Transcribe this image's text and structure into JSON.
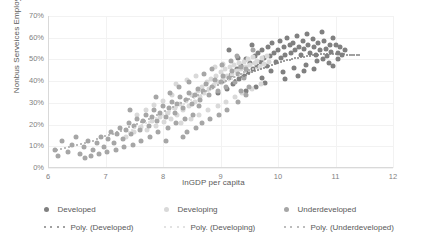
{
  "chart_data": {
    "type": "scatter",
    "title": "",
    "xlabel": "lnGDP per capita",
    "ylabel": "Nonbus Serveices Employment Share",
    "xlim": [
      6,
      12
    ],
    "ylim": [
      0,
      0.7
    ],
    "grid": true,
    "legend_position": "bottom",
    "xticks": [
      "6",
      "7",
      "8",
      "9",
      "10",
      "11",
      "12"
    ],
    "xtick_values": [
      6,
      7,
      8,
      9,
      10,
      11,
      12
    ],
    "yticks": [
      "0%",
      "10%",
      "20%",
      "30%",
      "40%",
      "50%",
      "60%",
      "70%"
    ],
    "ytick_values": [
      0,
      0.1,
      0.2,
      0.3,
      0.4,
      0.5,
      0.6,
      0.7
    ],
    "colors": {
      "developed": "#808080",
      "developing": "#d9d9d9",
      "underdeveloped": "#a6a6a6",
      "gridline": "#f2f2f2",
      "axis": "#d9d9d9",
      "text": "#595959"
    },
    "series": [
      {
        "name": "Developed",
        "color": "#808080",
        "points": [
          [
            8.95,
            0.345
          ],
          [
            9.05,
            0.4
          ],
          [
            9.12,
            0.365
          ],
          [
            9.18,
            0.43
          ],
          [
            9.22,
            0.385
          ],
          [
            9.28,
            0.455
          ],
          [
            9.33,
            0.41
          ],
          [
            9.36,
            0.47
          ],
          [
            9.4,
            0.425
          ],
          [
            9.44,
            0.5
          ],
          [
            9.48,
            0.44
          ],
          [
            9.52,
            0.485
          ],
          [
            9.56,
            0.455
          ],
          [
            9.6,
            0.515
          ],
          [
            9.63,
            0.47
          ],
          [
            9.66,
            0.53
          ],
          [
            9.7,
            0.49
          ],
          [
            9.73,
            0.545
          ],
          [
            9.76,
            0.505
          ],
          [
            9.8,
            0.47
          ],
          [
            9.83,
            0.555
          ],
          [
            9.86,
            0.515
          ],
          [
            9.9,
            0.575
          ],
          [
            9.93,
            0.53
          ],
          [
            9.96,
            0.49
          ],
          [
            10.0,
            0.545
          ],
          [
            10.03,
            0.585
          ],
          [
            10.06,
            0.505
          ],
          [
            10.1,
            0.555
          ],
          [
            10.13,
            0.52
          ],
          [
            10.16,
            0.6
          ],
          [
            10.2,
            0.565
          ],
          [
            10.23,
            0.53
          ],
          [
            10.26,
            0.575
          ],
          [
            10.3,
            0.545
          ],
          [
            10.33,
            0.61
          ],
          [
            10.36,
            0.555
          ],
          [
            10.4,
            0.52
          ],
          [
            10.43,
            0.585
          ],
          [
            10.46,
            0.55
          ],
          [
            10.5,
            0.615
          ],
          [
            10.53,
            0.565
          ],
          [
            10.56,
            0.53
          ],
          [
            10.6,
            0.595
          ],
          [
            10.63,
            0.555
          ],
          [
            10.66,
            0.52
          ],
          [
            10.7,
            0.575
          ],
          [
            10.73,
            0.545
          ],
          [
            10.76,
            0.625
          ],
          [
            10.8,
            0.585
          ],
          [
            10.83,
            0.55
          ],
          [
            10.86,
            0.515
          ],
          [
            10.9,
            0.565
          ],
          [
            10.93,
            0.535
          ],
          [
            10.96,
            0.6
          ],
          [
            11.0,
            0.565
          ],
          [
            11.04,
            0.53
          ],
          [
            11.08,
            0.555
          ],
          [
            11.12,
            0.52
          ],
          [
            11.16,
            0.545
          ],
          [
            9.15,
            0.545
          ],
          [
            9.3,
            0.505
          ],
          [
            9.55,
            0.565
          ],
          [
            9.72,
            0.415
          ],
          [
            9.88,
            0.445
          ],
          [
            10.08,
            0.44
          ],
          [
            10.28,
            0.46
          ],
          [
            10.48,
            0.475
          ],
          [
            10.68,
            0.495
          ],
          [
            10.88,
            0.485
          ],
          [
            10.45,
            0.445
          ],
          [
            10.62,
            0.455
          ],
          [
            10.78,
            0.5
          ],
          [
            10.95,
            0.47
          ],
          [
            11.05,
            0.5
          ],
          [
            9.45,
            0.355
          ],
          [
            9.62,
            0.375
          ],
          [
            9.78,
            0.39
          ],
          [
            10.12,
            0.41
          ],
          [
            10.35,
            0.425
          ]
        ]
      },
      {
        "name": "Developing",
        "color": "#d9d9d9",
        "points": [
          [
            7.35,
            0.145
          ],
          [
            7.5,
            0.165
          ],
          [
            7.62,
            0.19
          ],
          [
            7.72,
            0.175
          ],
          [
            7.8,
            0.215
          ],
          [
            7.88,
            0.195
          ],
          [
            7.95,
            0.235
          ],
          [
            8.02,
            0.21
          ],
          [
            8.08,
            0.255
          ],
          [
            8.14,
            0.225
          ],
          [
            8.2,
            0.275
          ],
          [
            8.25,
            0.245
          ],
          [
            8.3,
            0.295
          ],
          [
            8.35,
            0.265
          ],
          [
            8.4,
            0.315
          ],
          [
            8.45,
            0.285
          ],
          [
            8.5,
            0.335
          ],
          [
            8.55,
            0.305
          ],
          [
            8.6,
            0.355
          ],
          [
            8.64,
            0.325
          ],
          [
            8.68,
            0.375
          ],
          [
            8.72,
            0.345
          ],
          [
            8.76,
            0.395
          ],
          [
            8.8,
            0.365
          ],
          [
            8.84,
            0.41
          ],
          [
            8.88,
            0.38
          ],
          [
            8.92,
            0.425
          ],
          [
            8.96,
            0.395
          ],
          [
            9.0,
            0.44
          ],
          [
            9.04,
            0.41
          ],
          [
            9.08,
            0.455
          ],
          [
            9.12,
            0.425
          ],
          [
            9.16,
            0.465
          ],
          [
            9.2,
            0.435
          ],
          [
            9.24,
            0.475
          ],
          [
            9.28,
            0.445
          ],
          [
            9.32,
            0.485
          ],
          [
            9.36,
            0.455
          ],
          [
            9.4,
            0.49
          ],
          [
            9.44,
            0.465
          ],
          [
            9.48,
            0.5
          ],
          [
            9.52,
            0.475
          ],
          [
            9.56,
            0.51
          ],
          [
            9.6,
            0.485
          ],
          [
            9.64,
            0.495
          ],
          [
            9.68,
            0.465
          ],
          [
            9.72,
            0.505
          ],
          [
            9.76,
            0.48
          ],
          [
            9.8,
            0.515
          ],
          [
            9.84,
            0.49
          ],
          [
            7.55,
            0.245
          ],
          [
            7.7,
            0.265
          ],
          [
            7.85,
            0.29
          ],
          [
            8.0,
            0.31
          ],
          [
            8.15,
            0.335
          ],
          [
            8.32,
            0.205
          ],
          [
            8.48,
            0.225
          ],
          [
            8.62,
            0.245
          ],
          [
            8.78,
            0.265
          ],
          [
            8.95,
            0.285
          ],
          [
            9.1,
            0.305
          ],
          [
            9.25,
            0.325
          ],
          [
            9.38,
            0.345
          ],
          [
            9.55,
            0.365
          ],
          [
            9.7,
            0.385
          ],
          [
            8.22,
            0.385
          ],
          [
            8.42,
            0.405
          ],
          [
            8.58,
            0.425
          ],
          [
            8.9,
            0.465
          ],
          [
            9.05,
            0.48
          ]
        ]
      },
      {
        "name": "Underdeveloped",
        "color": "#a6a6a6",
        "points": [
          [
            6.12,
            0.085
          ],
          [
            6.18,
            0.055
          ],
          [
            6.35,
            0.075
          ],
          [
            6.42,
            0.105
          ],
          [
            6.55,
            0.065
          ],
          [
            6.62,
            0.095
          ],
          [
            6.7,
            0.125
          ],
          [
            6.78,
            0.085
          ],
          [
            6.85,
            0.115
          ],
          [
            6.92,
            0.145
          ],
          [
            6.98,
            0.095
          ],
          [
            7.05,
            0.135
          ],
          [
            7.1,
            0.165
          ],
          [
            7.15,
            0.115
          ],
          [
            7.2,
            0.155
          ],
          [
            7.25,
            0.185
          ],
          [
            7.3,
            0.135
          ],
          [
            7.35,
            0.175
          ],
          [
            7.4,
            0.205
          ],
          [
            7.45,
            0.155
          ],
          [
            7.5,
            0.195
          ],
          [
            7.55,
            0.225
          ],
          [
            7.6,
            0.175
          ],
          [
            7.65,
            0.215
          ],
          [
            7.7,
            0.245
          ],
          [
            7.75,
            0.195
          ],
          [
            7.8,
            0.235
          ],
          [
            7.85,
            0.265
          ],
          [
            7.9,
            0.215
          ],
          [
            7.95,
            0.255
          ],
          [
            8.0,
            0.285
          ],
          [
            8.05,
            0.235
          ],
          [
            8.1,
            0.275
          ],
          [
            8.15,
            0.305
          ],
          [
            8.2,
            0.255
          ],
          [
            8.25,
            0.295
          ],
          [
            8.3,
            0.325
          ],
          [
            8.35,
            0.275
          ],
          [
            8.4,
            0.315
          ],
          [
            8.45,
            0.345
          ],
          [
            8.5,
            0.295
          ],
          [
            8.55,
            0.335
          ],
          [
            8.6,
            0.365
          ],
          [
            8.65,
            0.315
          ],
          [
            8.7,
            0.355
          ],
          [
            8.75,
            0.385
          ],
          [
            8.8,
            0.335
          ],
          [
            8.85,
            0.375
          ],
          [
            8.9,
            0.405
          ],
          [
            8.95,
            0.355
          ],
          [
            9.0,
            0.395
          ],
          [
            9.05,
            0.425
          ],
          [
            9.1,
            0.375
          ],
          [
            9.15,
            0.415
          ],
          [
            9.2,
            0.445
          ],
          [
            9.25,
            0.395
          ],
          [
            9.3,
            0.435
          ],
          [
            9.35,
            0.465
          ],
          [
            9.4,
            0.415
          ],
          [
            9.45,
            0.455
          ],
          [
            6.25,
            0.125
          ],
          [
            6.48,
            0.145
          ],
          [
            6.65,
            0.045
          ],
          [
            6.75,
            0.055
          ],
          [
            6.88,
            0.065
          ],
          [
            7.02,
            0.075
          ],
          [
            7.18,
            0.085
          ],
          [
            7.32,
            0.095
          ],
          [
            7.48,
            0.105
          ],
          [
            7.62,
            0.125
          ],
          [
            7.78,
            0.145
          ],
          [
            7.92,
            0.165
          ],
          [
            8.08,
            0.185
          ],
          [
            8.22,
            0.205
          ],
          [
            8.38,
            0.225
          ],
          [
            8.52,
            0.245
          ],
          [
            8.68,
            0.205
          ],
          [
            8.82,
            0.225
          ],
          [
            8.98,
            0.245
          ],
          [
            9.12,
            0.265
          ],
          [
            7.88,
            0.325
          ],
          [
            8.12,
            0.345
          ],
          [
            8.28,
            0.375
          ],
          [
            8.46,
            0.395
          ],
          [
            8.62,
            0.285
          ],
          [
            8.72,
            0.435
          ],
          [
            8.86,
            0.455
          ],
          [
            9.02,
            0.475
          ],
          [
            9.18,
            0.495
          ],
          [
            9.28,
            0.515
          ],
          [
            9.36,
            0.355
          ],
          [
            9.5,
            0.375
          ],
          [
            9.56,
            0.545
          ],
          [
            8.42,
            0.165
          ],
          [
            8.58,
            0.185
          ],
          [
            9.3,
            0.305
          ],
          [
            9.44,
            0.335
          ],
          [
            8.05,
            0.125
          ],
          [
            8.35,
            0.145
          ],
          [
            7.42,
            0.265
          ]
        ]
      }
    ],
    "trendlines": [
      {
        "name": "Poly. (Developed)",
        "color": "#808080",
        "style": "dotted",
        "points": [
          [
            9.25,
            0.405
          ],
          [
            9.5,
            0.435
          ],
          [
            9.75,
            0.462
          ],
          [
            10.0,
            0.485
          ],
          [
            10.25,
            0.503
          ],
          [
            10.5,
            0.516
          ],
          [
            10.75,
            0.523
          ],
          [
            11.0,
            0.525
          ],
          [
            11.25,
            0.522
          ],
          [
            11.45,
            0.518
          ]
        ]
      },
      {
        "name": "Poly. (Developing)",
        "color": "#d9d9d9",
        "style": "dotted",
        "points": [
          [
            7.4,
            0.168
          ],
          [
            7.7,
            0.205
          ],
          [
            8.0,
            0.245
          ],
          [
            8.3,
            0.288
          ],
          [
            8.6,
            0.33
          ],
          [
            8.9,
            0.372
          ],
          [
            9.2,
            0.412
          ],
          [
            9.5,
            0.448
          ],
          [
            9.8,
            0.48
          ]
        ]
      },
      {
        "name": "Poly. (Underdeveloped)",
        "color": "#a6a6a6",
        "style": "dotted",
        "points": [
          [
            6.15,
            0.082
          ],
          [
            6.5,
            0.105
          ],
          [
            6.85,
            0.132
          ],
          [
            7.2,
            0.165
          ],
          [
            7.55,
            0.202
          ],
          [
            7.9,
            0.243
          ],
          [
            8.25,
            0.288
          ],
          [
            8.6,
            0.335
          ],
          [
            8.95,
            0.382
          ],
          [
            9.3,
            0.428
          ],
          [
            9.55,
            0.46
          ]
        ]
      }
    ]
  },
  "legend": {
    "row1": [
      {
        "label": "Developed",
        "color": "#808080"
      },
      {
        "label": "Developing",
        "color": "#d9d9d9"
      },
      {
        "label": "Underdeveloped",
        "color": "#a6a6a6"
      }
    ],
    "row2": [
      {
        "label": "Poly. (Developed)",
        "color": "#808080"
      },
      {
        "label": "Poly. (Developing)",
        "color": "#d9d9d9"
      },
      {
        "label": "Poly. (Underdeveloped)",
        "color": "#a6a6a6"
      }
    ]
  }
}
